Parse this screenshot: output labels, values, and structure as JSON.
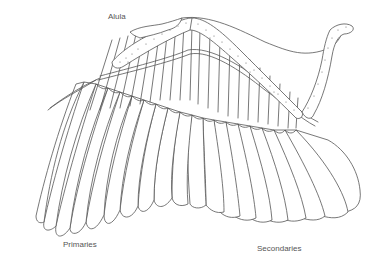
{
  "diagram": {
    "colors": {
      "background": "#ffffff",
      "line": "#555555",
      "label_text": "#555555"
    },
    "labels": [
      {
        "id": "alula",
        "text": "Alula",
        "x": 108,
        "y": 13
      },
      {
        "id": "primaries",
        "text": "Primaries",
        "x": 63,
        "y": 241
      },
      {
        "id": "secondaries",
        "text": "Secondaries",
        "x": 257,
        "y": 245
      }
    ],
    "parts": {
      "alula": "Alula",
      "primaries": "Primaries",
      "secondaries": "Secondaries"
    }
  }
}
